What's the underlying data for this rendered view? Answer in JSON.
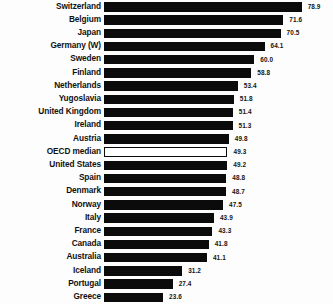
{
  "chart_data": {
    "type": "bar",
    "orientation": "horizontal",
    "title": "",
    "subtitle": "",
    "xlabel": "",
    "ylabel": "",
    "xlim": [
      0,
      78.9
    ],
    "grid": false,
    "legend": null,
    "value_labels": true,
    "categories": [
      "Switzerland",
      "Belgium",
      "Japan",
      "Germany (W)",
      "Sweden",
      "Finland",
      "Netherlands",
      "Yugoslavia",
      "United Kingdom",
      "Ireland",
      "Austria",
      "OECD median",
      "United States",
      "Spain",
      "Denmark",
      "Norway",
      "Italy",
      "France",
      "Canada",
      "Australia",
      "Iceland",
      "Portugal",
      "Greece"
    ],
    "values": [
      78.9,
      71.6,
      70.5,
      64.1,
      60.0,
      58.8,
      53.4,
      51.8,
      51.4,
      51.3,
      49.8,
      49.3,
      49.2,
      48.8,
      48.7,
      47.5,
      43.9,
      43.3,
      41.8,
      41.1,
      31.2,
      27.4,
      23.6
    ],
    "value_text": [
      "78.9",
      "71.6",
      "70.5",
      "64.1",
      "60.0",
      "58.8",
      "53.4",
      "51.8",
      "51.4",
      "51.3",
      "49.8",
      "49.3",
      "49.2",
      "48.8",
      "48.7",
      "47.5",
      "43.9",
      "43.3",
      "41.8",
      "41.1",
      "31.2",
      "27.4",
      "23.6"
    ],
    "highlight_category": "OECD median",
    "highlight_style": "hollow-outline",
    "colors": {
      "bar": "#0b0b0b",
      "highlight_fill": "#ffffff",
      "highlight_stroke": "#0b0b0b",
      "label_text": "#111111",
      "value_text": "#141414",
      "background": "#fdfdfd"
    }
  }
}
